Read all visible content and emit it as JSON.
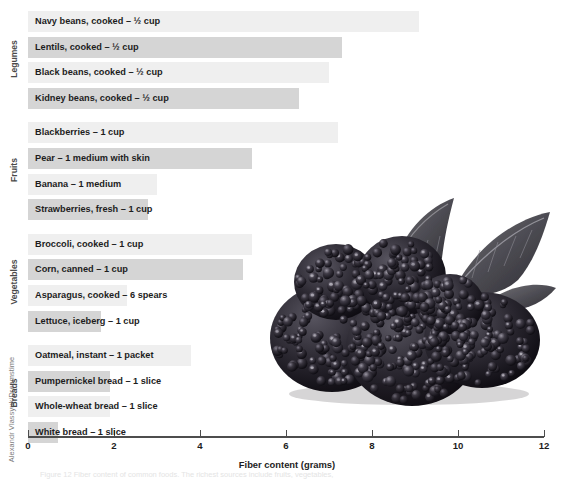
{
  "credit": "Alexandr Vlassyuk/Dreamstime",
  "caption": "Figure 12   Fiber content of common foods. The richest sources include fruits, vegetables,",
  "axis": {
    "title": "Fiber content (grams)",
    "ticks": [
      "0",
      "2",
      "4",
      "6",
      "8",
      "10",
      "12"
    ],
    "min": 0,
    "max": 12
  },
  "groups": [
    {
      "name": "Legumes",
      "items": [
        {
          "label": "Navy beans, cooked – ½ cup",
          "value": 9.1
        },
        {
          "label": "Lentils, cooked – ½ cup",
          "value": 7.3
        },
        {
          "label": "Black beans, cooked – ½ cup",
          "value": 7.0
        },
        {
          "label": "Kidney beans, cooked – ½ cup",
          "value": 6.3
        }
      ]
    },
    {
      "name": "Fruits",
      "items": [
        {
          "label": "Blackberries – 1 cup",
          "value": 7.2
        },
        {
          "label": "Pear – 1 medium with skin",
          "value": 5.2
        },
        {
          "label": "Banana – 1 medium",
          "value": 3.0
        },
        {
          "label": "Strawberries, fresh – 1 cup",
          "value": 2.8
        }
      ]
    },
    {
      "name": "Vegetables",
      "items": [
        {
          "label": "Broccoli, cooked – 1 cup",
          "value": 5.2
        },
        {
          "label": "Corn, canned – 1 cup",
          "value": 5.0
        },
        {
          "label": "Asparagus, cooked – 6 spears",
          "value": 2.3
        },
        {
          "label": "Lettuce, iceberg – 1 cup",
          "value": 1.7
        }
      ]
    },
    {
      "name": "Breads",
      "items": [
        {
          "label": "Oatmeal, instant – 1 packet",
          "value": 3.8
        },
        {
          "label": "Pumpernickel bread – 1 slice",
          "value": 1.9
        },
        {
          "label": "Whole-wheat bread – 1 slice",
          "value": 1.9
        },
        {
          "label": "White bread – 1 slice",
          "value": 0.7
        }
      ]
    }
  ],
  "photo": {
    "alt_name": "blackberries-photo"
  },
  "chart_data": {
    "type": "bar",
    "orientation": "horizontal",
    "title": "",
    "xlabel": "Fiber content (grams)",
    "ylabel": "",
    "xlim": [
      0,
      12
    ],
    "xticks": [
      0,
      2,
      4,
      6,
      8,
      10,
      12
    ],
    "grid": false,
    "legend": "none",
    "categories": [
      "Navy beans, cooked – ½ cup",
      "Lentils, cooked – ½ cup",
      "Black beans, cooked – ½ cup",
      "Kidney beans, cooked – ½ cup",
      "Blackberries – 1 cup",
      "Pear – 1 medium with skin",
      "Banana – 1 medium",
      "Strawberries, fresh – 1 cup",
      "Broccoli, cooked – 1 cup",
      "Corn, canned – 1 cup",
      "Asparagus, cooked – 6 spears",
      "Lettuce, iceberg – 1 cup",
      "Oatmeal, instant – 1 packet",
      "Pumpernickel bread – 1 slice",
      "Whole-wheat bread – 1 slice",
      "White bread – 1 slice"
    ],
    "values": [
      9.1,
      7.3,
      7.0,
      6.3,
      7.2,
      5.2,
      3.0,
      2.8,
      5.2,
      5.0,
      2.3,
      1.7,
      3.8,
      1.9,
      1.9,
      0.7
    ],
    "group_labels": [
      "Legumes",
      "Fruits",
      "Vegetables",
      "Breads"
    ],
    "bar_colors": [
      "#efefef",
      "#d5d5d5"
    ]
  }
}
